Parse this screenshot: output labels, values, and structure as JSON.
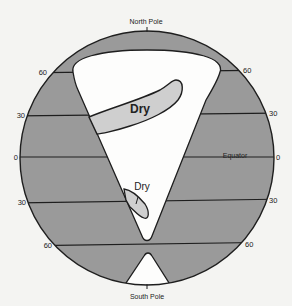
{
  "diagram": {
    "title_top": "North Pole",
    "title_bottom": "South Pole",
    "equator_label": "Equator",
    "left_latitudes": [
      "60",
      "30",
      "0",
      "30",
      "60"
    ],
    "right_latitudes": [
      "60",
      "30",
      "0",
      "30",
      "60"
    ],
    "regions": [
      {
        "name": "dry-region-north",
        "label": "Dry"
      },
      {
        "name": "dry-region-south",
        "label": "Dry"
      }
    ],
    "colors": {
      "background": "#f4f4f2",
      "land": "#9a9a9a",
      "dry": "#cfcfcf",
      "white": "#fdfdfc",
      "stroke": "#1e1e1e"
    }
  }
}
